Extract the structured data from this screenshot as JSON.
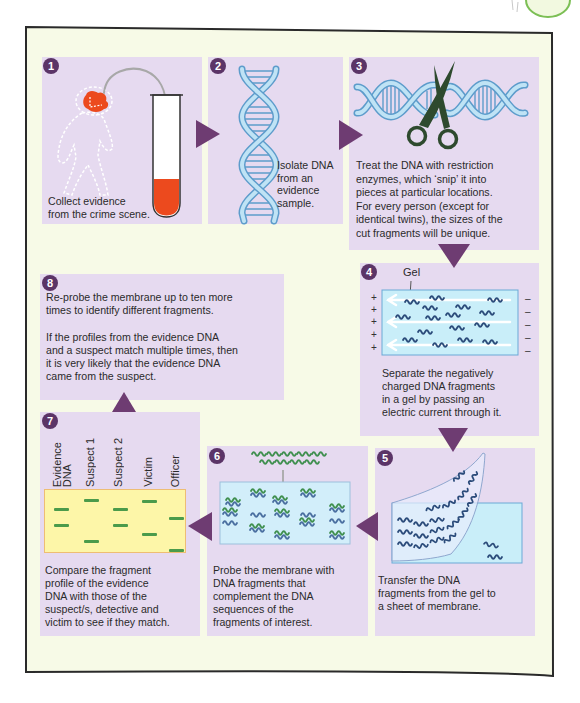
{
  "colors": {
    "frame_background": "#f7fae7",
    "panel_background": "#e6daf0",
    "step_number": "#5b3467",
    "arrow": "#6e3c72",
    "dna_blue": "#bfe3f5",
    "gel_blue": "#c9eef9",
    "evidence_red": "#ec4a1e",
    "probe_green": "#3f8f4f",
    "comparison_gel_yellow": "#fdf6a8"
  },
  "steps": [
    {
      "number": "1",
      "text": [
        "Collect evidence",
        "from the crime scene."
      ]
    },
    {
      "number": "2",
      "text": [
        "Isolate DNA",
        "from an",
        "evidence",
        "sample."
      ]
    },
    {
      "number": "3",
      "text": [
        "Treat the DNA with restriction",
        "enzymes, which ‘snip’ it into",
        "pieces at particular  locations.",
        "For every person (except for",
        "identical twins), the sizes of the",
        "cut fragments will be unique."
      ]
    },
    {
      "number": "4",
      "gel_label": "Gel",
      "positive_signs": [
        "+",
        "+",
        "+",
        "+",
        "+"
      ],
      "negative_signs": [
        "–",
        "–",
        "–",
        "–",
        "–"
      ],
      "text": [
        "Separate the negatively",
        "charged DNA fragments",
        "in a gel by passing an",
        "electric current through it."
      ]
    },
    {
      "number": "5",
      "text": [
        "Transfer the DNA",
        "fragments from the gel to",
        "a sheet of membrane."
      ]
    },
    {
      "number": "6",
      "text": [
        "Probe the membrane with",
        "DNA fragments that",
        "complement the DNA",
        "sequences of the",
        "fragments of interest."
      ]
    },
    {
      "number": "7",
      "lanes": [
        {
          "label": [
            "Evidence",
            "DNA"
          ],
          "bands": [
            18,
            34
          ]
        },
        {
          "label": [
            "Suspect 1"
          ],
          "bands": [
            9,
            50
          ]
        },
        {
          "label": [
            "Suspect 2"
          ],
          "bands": [
            18,
            34
          ]
        },
        {
          "label": [
            "Victim"
          ],
          "bands": [
            10,
            43
          ]
        },
        {
          "label": [
            "Officer"
          ],
          "bands": [
            27,
            59
          ]
        }
      ],
      "text": [
        "Compare the fragment",
        "profile of the evidence",
        "DNA with those of the",
        "suspect/s, detective and",
        "victim to see if they match."
      ]
    },
    {
      "number": "8",
      "paragraphs": [
        [
          "Re-probe the membrane up to ten more",
          "times to identify different fragments."
        ],
        [
          "If the profiles from the evidence DNA",
          "and a suspect match multiple times, then",
          "it is very likely that the evidence DNA",
          "came from the suspect."
        ]
      ]
    }
  ]
}
